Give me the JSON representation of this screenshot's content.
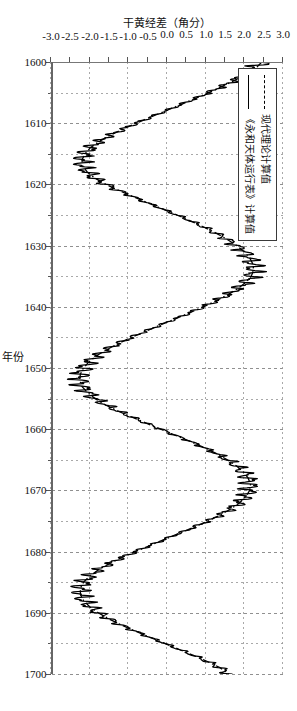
{
  "figure": {
    "orientation": "rotated-90-clockwise",
    "background": "#ffffff"
  },
  "legend": {
    "position": "top-left-inside",
    "items": [
      {
        "label": "现代理论计算值",
        "style": "dash-dot",
        "color": "#000000",
        "icon": "dash-dot-line-icon"
      },
      {
        "label": "《永和天体运行表》计算值",
        "style": "solid",
        "color": "#000000",
        "icon": "solid-line-icon"
      }
    ]
  },
  "chart_data": {
    "type": "line",
    "title": "",
    "xlabel": "年份",
    "ylabel": "干黄经差（角分）",
    "xlim": [
      1600,
      1700
    ],
    "ylim": [
      -3.0,
      3.0
    ],
    "grid": true,
    "x_ticks": [
      1600,
      1610,
      1620,
      1630,
      1640,
      1650,
      1660,
      1670,
      1680,
      1690,
      1700
    ],
    "x_minor_step": 5,
    "y_ticks": [
      3.0,
      2.5,
      2.0,
      1.5,
      1.0,
      0.5,
      0.0,
      -0.5,
      -1.0,
      -1.5,
      -2.0,
      -2.5,
      -3.0
    ],
    "y_tick_labels": [
      "3.0",
      "2.5",
      "2.0",
      "1.5",
      "1.0",
      "0.5",
      "0.0",
      "-0.5",
      "-1.0",
      "-1.5",
      "-2.0",
      "-2.5",
      "-3.0"
    ],
    "legend_position": "upper left",
    "series": [
      {
        "name": "现代理论计算值",
        "style": "dash-dot",
        "color": "#000000",
        "description": "Smooth quasi-sinusoidal oscillation, period ≈ 13 years, amplitude ≈ 2.4 arc-minutes, with slight secular drift.",
        "x": [
          1600,
          1601,
          1602,
          1603,
          1604,
          1605,
          1606,
          1607,
          1608,
          1609,
          1610,
          1611,
          1612,
          1613,
          1614,
          1615,
          1616,
          1617,
          1618,
          1619,
          1620,
          1621,
          1622,
          1623,
          1624,
          1625,
          1626,
          1627,
          1628,
          1629,
          1630,
          1631,
          1632,
          1633,
          1634,
          1635,
          1636,
          1637,
          1638,
          1639,
          1640,
          1641,
          1642,
          1643,
          1644,
          1645,
          1646,
          1647,
          1648,
          1649,
          1650,
          1651,
          1652,
          1653,
          1654,
          1655,
          1656,
          1657,
          1658,
          1659,
          1660,
          1661,
          1662,
          1663,
          1664,
          1665,
          1666,
          1667,
          1668,
          1669,
          1670,
          1671,
          1672,
          1673,
          1674,
          1675,
          1676,
          1677,
          1678,
          1679,
          1680,
          1681,
          1682,
          1683,
          1684,
          1685,
          1686,
          1687,
          1688,
          1689,
          1690,
          1691,
          1692,
          1693,
          1694,
          1695,
          1696,
          1697,
          1698,
          1699,
          1700
        ],
        "y": [
          2.45,
          2.3,
          2.05,
          1.75,
          1.42,
          1.08,
          0.72,
          0.34,
          -0.04,
          -0.42,
          -0.8,
          -1.15,
          -1.48,
          -1.76,
          -1.98,
          -2.12,
          -2.2,
          -2.18,
          -2.06,
          -1.86,
          -1.58,
          -1.24,
          -0.88,
          -0.5,
          -0.12,
          0.26,
          0.62,
          0.96,
          1.28,
          1.56,
          1.8,
          2.0,
          2.14,
          2.22,
          2.24,
          2.18,
          2.04,
          1.84,
          1.58,
          1.28,
          0.94,
          0.58,
          0.2,
          -0.18,
          -0.56,
          -0.92,
          -1.26,
          -1.56,
          -1.82,
          -2.02,
          -2.16,
          -2.24,
          -2.26,
          -2.2,
          -2.06,
          -1.86,
          -1.6,
          -1.28,
          -0.92,
          -0.54,
          -0.16,
          0.22,
          0.6,
          0.96,
          1.28,
          1.56,
          1.8,
          1.98,
          2.1,
          2.16,
          2.14,
          2.04,
          1.88,
          1.66,
          1.38,
          1.06,
          0.7,
          0.32,
          -0.06,
          -0.44,
          -0.82,
          -1.18,
          -1.5,
          -1.78,
          -2.0,
          -2.16,
          -2.24,
          -2.24,
          -2.16,
          -2.0,
          -1.78,
          -1.5,
          -1.18,
          -0.82,
          -0.44,
          -0.06,
          0.32,
          0.7,
          1.06,
          1.38,
          1.6
        ]
      },
      {
        "name": "《永和天体运行表》计算值",
        "style": "solid",
        "color": "#000000",
        "description": "Same long-period oscillation as the theoretical curve but carrying a strong high-frequency jitter (period ≈ 1 year, amplitude up to ≈ 0.35 arc-minutes) which becomes largest near the turning points of the slow wave.",
        "noise_amplitude": 0.3,
        "noise_period_years": 1
      }
    ],
    "annotations": []
  },
  "axes": {
    "x_title": "年份",
    "y_title": "干黄经差（角分）"
  }
}
